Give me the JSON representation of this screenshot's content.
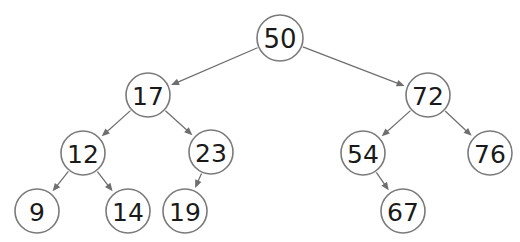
{
  "figure": {
    "kind": "binary-search-tree-diagram",
    "background_color": "#ffffff",
    "node_stroke_color": "#7a7a7a",
    "node_fill_color": "#ffffff",
    "label_color": "#1a1a1a",
    "edge_color": "#6e6e6e"
  },
  "nodes": [
    {
      "id": "n50",
      "label": "50",
      "cx": 280,
      "cy": 38,
      "r": 23,
      "font_size": 26
    },
    {
      "id": "n17",
      "label": "17",
      "cx": 148,
      "cy": 95,
      "r": 22,
      "font_size": 25
    },
    {
      "id": "n72",
      "label": "72",
      "cx": 428,
      "cy": 95,
      "r": 22,
      "font_size": 25
    },
    {
      "id": "n12",
      "label": "12",
      "cx": 83,
      "cy": 153,
      "r": 22,
      "font_size": 25
    },
    {
      "id": "n23",
      "label": "23",
      "cx": 211,
      "cy": 152,
      "r": 22,
      "font_size": 25
    },
    {
      "id": "n54",
      "label": "54",
      "cx": 363,
      "cy": 153,
      "r": 22,
      "font_size": 25
    },
    {
      "id": "n76",
      "label": "76",
      "cx": 490,
      "cy": 153,
      "r": 22,
      "font_size": 25
    },
    {
      "id": "n9",
      "label": "9",
      "cx": 37,
      "cy": 211,
      "r": 22,
      "font_size": 25
    },
    {
      "id": "n14",
      "label": "14",
      "cx": 128,
      "cy": 211,
      "r": 22,
      "font_size": 25
    },
    {
      "id": "n19",
      "label": "19",
      "cx": 185,
      "cy": 211,
      "r": 22,
      "font_size": 25
    },
    {
      "id": "n67",
      "label": "67",
      "cx": 403,
      "cy": 211,
      "r": 22,
      "font_size": 25
    }
  ],
  "edges": [
    {
      "from": "n50",
      "to": "n17",
      "side": "left"
    },
    {
      "from": "n50",
      "to": "n72",
      "side": "right"
    },
    {
      "from": "n17",
      "to": "n12",
      "side": "left"
    },
    {
      "from": "n17",
      "to": "n23",
      "side": "right"
    },
    {
      "from": "n12",
      "to": "n9",
      "side": "left"
    },
    {
      "from": "n12",
      "to": "n14",
      "side": "right"
    },
    {
      "from": "n23",
      "to": "n19",
      "side": "left"
    },
    {
      "from": "n72",
      "to": "n54",
      "side": "left"
    },
    {
      "from": "n72",
      "to": "n76",
      "side": "right"
    },
    {
      "from": "n54",
      "to": "n67",
      "side": "right"
    }
  ]
}
